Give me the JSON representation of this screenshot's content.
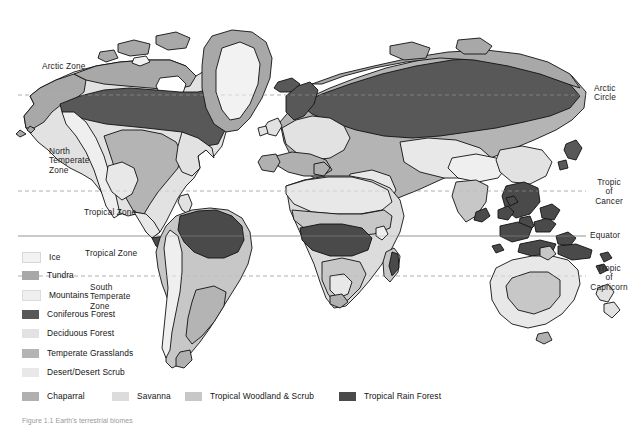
{
  "figure": {
    "kind": "world-biome-map",
    "caption": "Figure 1.1  Earth's terrestrial biomes"
  },
  "colors": {
    "background": "#ffffff",
    "ocean": "#ffffff",
    "coastline": "#111111",
    "latitude_line": "#b9b9b9",
    "equator_line": "#9e9e9e",
    "ice": "#f2f2f2",
    "tundra": "#a8a8a8",
    "mountains": "#efefef",
    "coniferous_forest": "#585858",
    "deciduous_forest": "#e2e2e2",
    "temperate_grasslands": "#b4b4b4",
    "desert_desert_scrub": "#e8e8e8",
    "chaparral": "#b0b0b0",
    "savanna": "#dcdcdc",
    "tropical_woodland_scrub": "#c7c7c7",
    "tropical_rain_forest": "#4a4a4a",
    "label_text": "#1c1c1c"
  },
  "latitude_lines": [
    {
      "name": "arctic-circle",
      "label": "Arctic\nCircle",
      "style": "dashed",
      "y": 95
    },
    {
      "name": "tropic-of-cancer",
      "label": "Tropic\nof\nCancer",
      "style": "dashed",
      "y": 191
    },
    {
      "name": "equator",
      "label": "Equator",
      "style": "solid",
      "y": 236
    },
    {
      "name": "tropic-of-capricorn",
      "label": "Tropic\nof\nCapricorn",
      "style": "dashed",
      "y": 276
    }
  ],
  "right_labels": [
    {
      "name": "arctic-circle-label",
      "text": "Arctic\nCircle",
      "x": 594,
      "y": 88
    },
    {
      "name": "tropic-of-cancer-label",
      "text": "Tropic\nof\nCancer",
      "x": 591,
      "y": 182
    },
    {
      "name": "equator-label",
      "text": "Equator",
      "x": 590,
      "y": 232
    },
    {
      "name": "tropic-of-capricorn-label",
      "text": "Tropic\nof\nCapricorn",
      "x": 589,
      "y": 267
    }
  ],
  "zone_labels": [
    {
      "name": "arctic-zone-label",
      "text": "Arctic  Zone",
      "x": 42,
      "y": 66
    },
    {
      "name": "north-temperate-zone-label",
      "text": "North\nTemperate\nZone",
      "x": 49,
      "y": 151
    },
    {
      "name": "tropical-zone-north-label",
      "text": "Tropical Zone",
      "x": 84,
      "y": 211
    },
    {
      "name": "tropical-zone-south-label",
      "text": "Tropical Zone",
      "x": 85,
      "y": 252
    },
    {
      "name": "south-temperate-zone-label",
      "text": "South\nTemperate\nZone",
      "x": 90,
      "y": 286
    }
  ],
  "legend": {
    "column_items": [
      {
        "name": "legend-ice",
        "label": "Ice",
        "color": "#f2f2f2",
        "x": 22,
        "y": 252
      },
      {
        "name": "legend-tundra",
        "label": "Tundra",
        "color": "#a8a8a8",
        "x": 22,
        "y": 271
      },
      {
        "name": "legend-mountains",
        "label": "Mountains",
        "color": "#efefef",
        "x": 22,
        "y": 290
      },
      {
        "name": "legend-coniferous-forest",
        "label": "Coniferous Forest",
        "color": "#585858",
        "x": 22,
        "y": 310
      },
      {
        "name": "legend-deciduous-forest",
        "label": "Deciduous Forest",
        "color": "#e2e2e2",
        "x": 22,
        "y": 329
      },
      {
        "name": "legend-temperate-grasslands",
        "label": "Temperate Grasslands",
        "color": "#b4b4b4",
        "x": 22,
        "y": 349
      },
      {
        "name": "legend-desert-desert-scrub",
        "label": "Desert/Desert Scrub",
        "color": "#e8e8e8",
        "x": 22,
        "y": 368
      }
    ],
    "row_items": [
      {
        "name": "legend-chaparral",
        "label": "Chaparral",
        "color": "#b0b0b0",
        "x": 22,
        "y": 392
      },
      {
        "name": "legend-savanna",
        "label": "Savanna",
        "color": "#dcdcdc",
        "x": 112,
        "y": 392
      },
      {
        "name": "legend-tropical-woodland-scrub",
        "label": "Tropical Woodland & Scrub",
        "color": "#c7c7c7",
        "x": 185,
        "y": 392
      },
      {
        "name": "legend-tropical-rain-forest",
        "label": "Tropical Rain Forest",
        "color": "#4a4a4a",
        "x": 339,
        "y": 392
      }
    ]
  }
}
